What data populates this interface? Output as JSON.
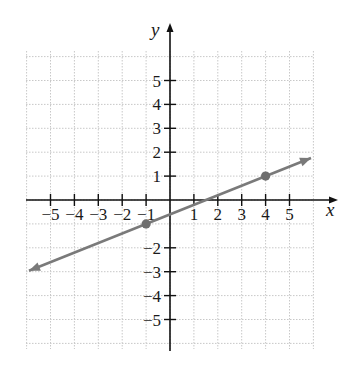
{
  "chart_data": {
    "type": "line",
    "title": "",
    "xlabel": "x",
    "ylabel": "y",
    "xlim": [
      -6,
      6
    ],
    "ylim": [
      -6,
      6
    ],
    "grid": true,
    "x_ticks": [
      -5,
      -4,
      -3,
      -2,
      -1,
      1,
      2,
      3,
      4,
      5
    ],
    "y_ticks": [
      5,
      4,
      3,
      2,
      1,
      -2,
      -3,
      -4,
      -5
    ],
    "x_tick_labels": [
      "−5",
      "−4",
      "−3",
      "−2",
      "−1",
      "1",
      "2",
      "3",
      "4",
      "5"
    ],
    "y_tick_labels": [
      "5",
      "4",
      "3",
      "2",
      "1",
      "−2",
      "−3",
      "−4",
      "−5"
    ],
    "series": [
      {
        "name": "line",
        "equation": "y = (2/5)x - 3/5",
        "slope": 0.4,
        "intercept": -0.6,
        "extends_both_directions": true,
        "x": [
          -5.9,
          5.9
        ],
        "y": [
          -2.96,
          1.76
        ],
        "color": "#7a7a7a"
      }
    ],
    "points": [
      {
        "x": -1,
        "y": -1
      },
      {
        "x": 4,
        "y": 1
      }
    ]
  },
  "colors": {
    "axis": "#111111",
    "grid": "#c8c8c8",
    "line": "#7a7a7a",
    "point": "#6e6e6e"
  }
}
